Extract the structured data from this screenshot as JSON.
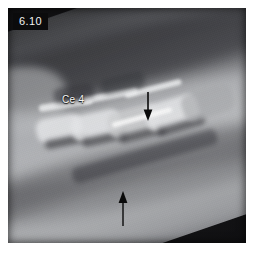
{
  "figure": {
    "number_label": "6.10",
    "domain": "radiograph",
    "modality": "lateral cervical spine radiograph",
    "background_color": "#0d0d0e",
    "paper_color": "#ffffff"
  },
  "plate": {
    "label_text_color": "#f2f2f2",
    "label_background_color": "#0b0b0c",
    "rotation_degrees": -19
  },
  "annotations": [
    {
      "id": "vertebra-label",
      "type": "text",
      "text": "Ce 4",
      "color": "#f4f5f5",
      "x": 54,
      "y": 86
    },
    {
      "id": "arrow-upper",
      "type": "arrow",
      "direction": "down",
      "color": "#0a0a0a",
      "x": 133,
      "y": 84,
      "length": 28
    },
    {
      "id": "arrow-lower",
      "type": "arrow",
      "direction": "up",
      "color": "#0a0a0a",
      "x": 115,
      "y": 189,
      "length": 34
    }
  ],
  "anatomy": {
    "region": "cervical vertebrae",
    "labelled_structures": [
      "Ce 4"
    ]
  }
}
